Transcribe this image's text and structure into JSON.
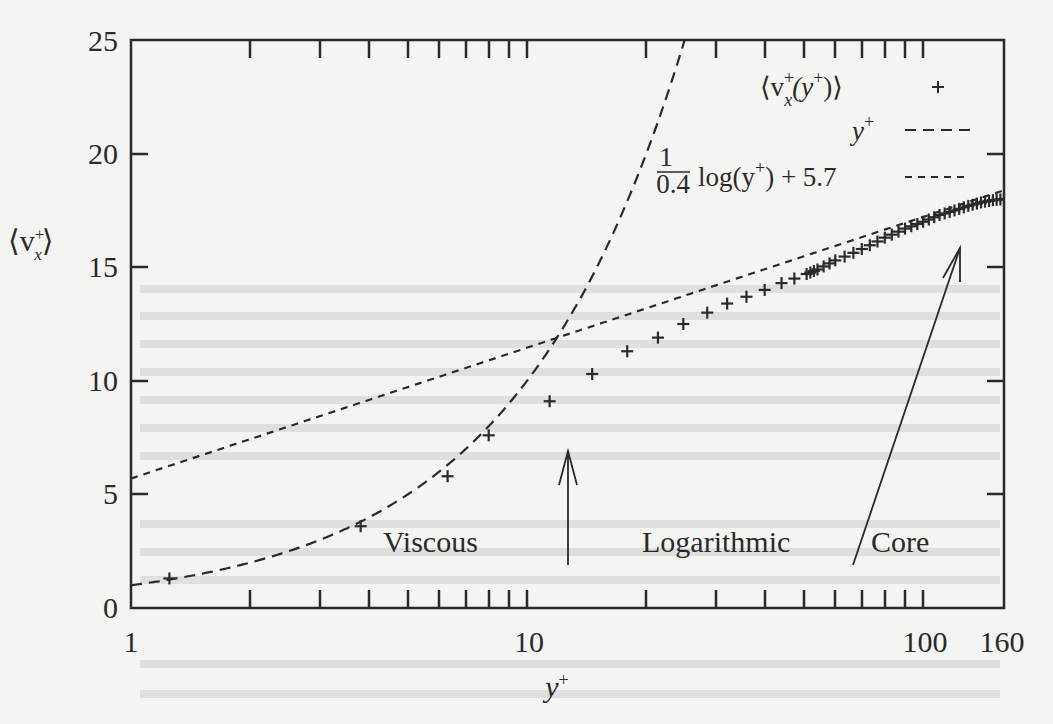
{
  "chart_data": {
    "type": "scatter",
    "title": "",
    "xlabel": "y+",
    "ylabel": "<v_x+>",
    "xscale": "log",
    "xlim": [
      1,
      160
    ],
    "ylim": [
      0,
      25
    ],
    "x_ticks": [
      1,
      10,
      100,
      160
    ],
    "x_tick_labels": [
      "1",
      "10",
      "100",
      "160"
    ],
    "y_ticks": [
      0,
      5,
      10,
      15,
      20,
      25
    ],
    "y_tick_labels": [
      "0",
      "5",
      "10",
      "15",
      "20",
      "25"
    ],
    "grid": false,
    "legend_position": "upper right",
    "series": [
      {
        "name": "<v_x+(y+)>",
        "style": "plus-markers",
        "x": [
          1.25,
          3.8,
          6.3,
          8.0,
          11.4,
          14.6,
          17.9,
          21.4,
          24.8,
          28.5,
          32.0,
          35.8,
          39.8,
          43.9,
          47.3,
          50.8,
          54.1,
          60,
          70,
          80,
          90,
          100,
          110,
          120,
          130,
          140,
          150,
          160
        ],
        "y": [
          1.3,
          3.6,
          5.8,
          7.6,
          9.1,
          10.3,
          11.3,
          11.9,
          12.5,
          13.0,
          13.4,
          13.7,
          14.0,
          14.3,
          14.5,
          14.7,
          14.9,
          15.3,
          15.8,
          16.3,
          16.7,
          17.0,
          17.3,
          17.5,
          17.7,
          17.85,
          17.95,
          18.0
        ]
      },
      {
        "name": "y+",
        "style": "dashed-line",
        "function": "v = y+",
        "x_range": [
          1,
          25
        ]
      },
      {
        "name": "(1/0.4) log(y+) + 5.7",
        "style": "dotted-line",
        "function": "v = 2.5*ln(y+) + 5.7",
        "x_range": [
          1,
          160
        ]
      }
    ],
    "annotations": [
      {
        "text": "Viscous",
        "arrow_to_x": 12.5
      },
      {
        "text": "Logarithmic"
      },
      {
        "text": "Core",
        "arrow_to_x": 120
      }
    ]
  },
  "axes": {
    "x_label": "y",
    "x_label_sup": "+",
    "y_label_left": "⟨v",
    "y_label_sub": "x",
    "y_label_sup": "+",
    "y_label_right": "⟩"
  },
  "ticks": {
    "x": [
      "1",
      "10",
      "100",
      "160"
    ],
    "y": [
      "0",
      "5",
      "10",
      "15",
      "20",
      "25"
    ]
  },
  "legend": {
    "entry1": {
      "prefix": "⟨v",
      "sub": "x",
      "sup": "+",
      "mid": "(y",
      "sup2": "+",
      "suffix": ")⟩"
    },
    "entry2": {
      "text": "y",
      "sup": "+"
    },
    "entry3": {
      "frac_num": "1",
      "frac_den": "0.4",
      "text": "log(y",
      "sup": "+",
      "suffix": ") + 5.7"
    }
  },
  "annotations": {
    "viscous": "Viscous",
    "logarithmic": "Logarithmic",
    "core": "Core"
  },
  "colors": {
    "ink": "#2a2a2a",
    "background": "#f4f4f2",
    "plot_background": "#ffffff"
  }
}
